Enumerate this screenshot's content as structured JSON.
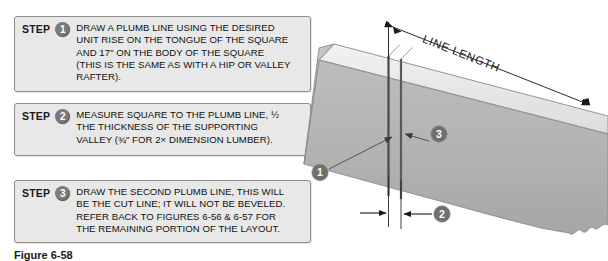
{
  "steps": [
    {
      "label": "STEP",
      "number": "1",
      "text": "DRAW A PLUMB LINE USING THE DESIRED\nUNIT RISE ON THE TONGUE OF THE SQUARE\nAND 17\" ON THE BODY OF THE SQUARE\n(THIS IS THE SAME AS WITH A HIP OR VALLEY\nRAFTER)."
    },
    {
      "label": "STEP",
      "number": "2",
      "text": "MEASURE SQUARE TO THE PLUMB LINE, ½\nTHE THICKNESS OF THE SUPPORTING\nVALLEY (¾\" FOR 2× DIMENSION LUMBER)."
    },
    {
      "label": "STEP",
      "number": "3",
      "text": "DRAW THE SECOND PLUMB LINE, THIS WILL\nBE THE CUT LINE; IT WILL NOT BE BEVELED.\nREFER BACK TO FIGURES 6-56 & 6-57 FOR\nTHE REMAINING PORTION OF THE LAYOUT."
    }
  ],
  "caption": "Figure 6-58",
  "diagram": {
    "dimension_label": "LINE LENGTH",
    "callouts": [
      {
        "number": "1"
      },
      {
        "number": "2"
      },
      {
        "number": "3"
      }
    ]
  },
  "colors": {
    "box_fill": "#e8e8e8",
    "box_border": "#8d8d8d",
    "badge_fill": "#7a7a7a",
    "badge_text": "#ffffff",
    "text": "#111111",
    "board_face": "#b4b4b4",
    "board_top": "#e9e9e9",
    "board_end": "#c9c9c9",
    "line_dark": "#4a4a4a",
    "leader": "#555555"
  }
}
